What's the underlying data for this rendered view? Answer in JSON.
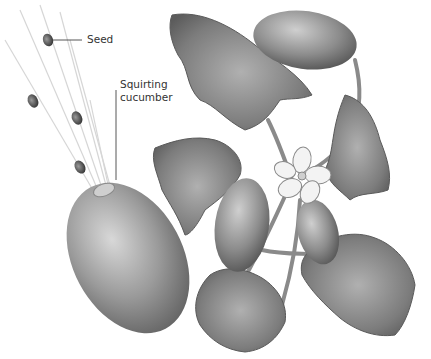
{
  "figure": {
    "labels": {
      "seed": "Seed",
      "cucumber_line1": "Squirting",
      "cucumber_line2": "cucumber"
    },
    "colors": {
      "background": "#ffffff",
      "label_text": "#333333",
      "leader_line": "#444444",
      "fruit_gray": "#8a8a8a",
      "leaf_gray": "#7a7a7a",
      "flower": "#f2f2f2"
    }
  }
}
